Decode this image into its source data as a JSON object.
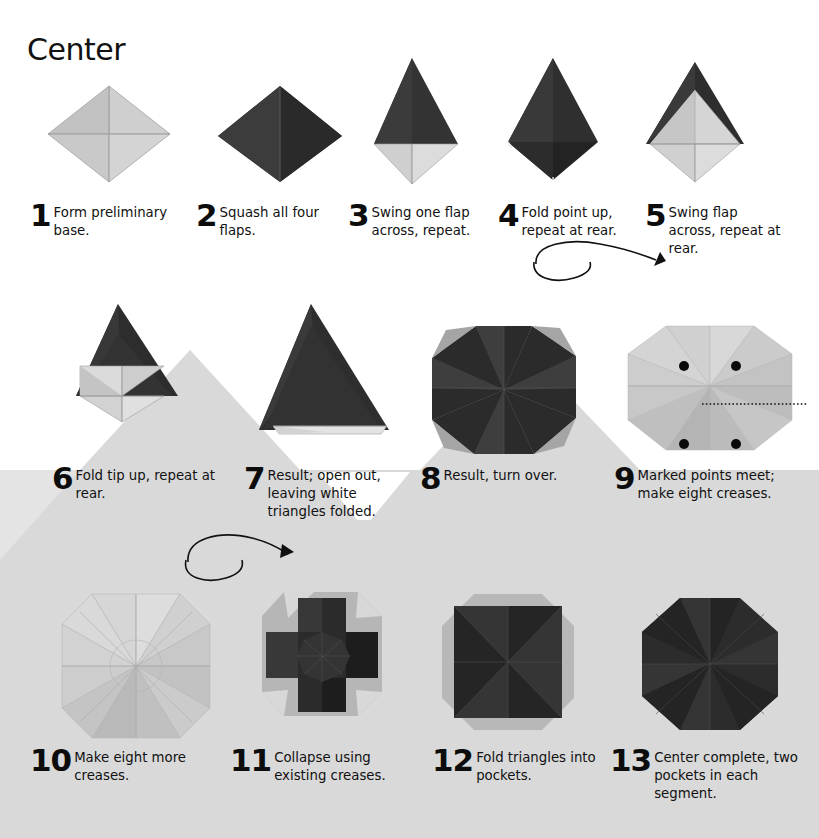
{
  "page": {
    "title": "Center",
    "width": 819,
    "height": 838,
    "background_color": "#ffffff",
    "band_color": "#d8d8d8",
    "band_color_light": "#e2e2e2"
  },
  "colors": {
    "paper_light_1": "#d2d2d2",
    "paper_light_2": "#bdbdbd",
    "paper_light_3": "#cacaca",
    "paper_light_4": "#b2b2b2",
    "paper_white": "#efefef",
    "paper_dark_1": "#3a3a3a",
    "paper_dark_2": "#2b2b2b",
    "paper_dark_3": "#4a4a4a",
    "paper_dark_4": "#202020",
    "marker_dot": "#0a0a0a",
    "crease_line": "#111111",
    "outline": "#8a8a8a"
  },
  "steps": [
    {
      "num": "1",
      "text": "Form preliminary base."
    },
    {
      "num": "2",
      "text": "Squash all four flaps."
    },
    {
      "num": "3",
      "text": "Swing one flap across, repeat."
    },
    {
      "num": "4",
      "text": "Fold point up, repeat at rear."
    },
    {
      "num": "5",
      "text": "Swing flap across, repeat at rear."
    },
    {
      "num": "6",
      "text": "Fold tip up, repeat at rear."
    },
    {
      "num": "7",
      "text": "Result; open out, leaving white triangles folded."
    },
    {
      "num": "8",
      "text": "Result, turn over."
    },
    {
      "num": "9",
      "text": "Marked points meet; make eight creases."
    },
    {
      "num": "10",
      "text": "Make eight more creases."
    },
    {
      "num": "11",
      "text": "Collapse using existing creases."
    },
    {
      "num": "12",
      "text": "Fold triangles into pockets."
    },
    {
      "num": "13",
      "text": "Center complete, two pockets in each segment."
    }
  ],
  "annotations": {
    "turn_over_arrow_1": "turn-over-arrow",
    "turn_over_arrow_2": "turn-over-arrow",
    "marked_points_count": 4,
    "crease_line_style": "dotted"
  }
}
